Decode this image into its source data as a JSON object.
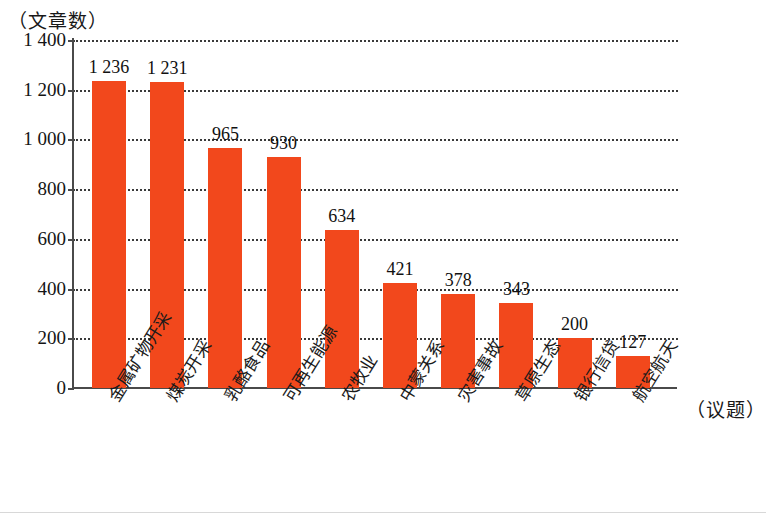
{
  "chart_data": {
    "type": "bar",
    "title": "",
    "subtitle": "",
    "xlabel": "（议题）",
    "ylabel": "（文章数）",
    "categories": [
      "金属矿物开采",
      "煤炭开采",
      "乳酪食品",
      "可再生能源",
      "农牧业",
      "中蒙关系",
      "灾害事故",
      "草原生态",
      "银行信贷",
      "航空航天"
    ],
    "values": [
      1236,
      1231,
      965,
      930,
      634,
      421,
      378,
      343,
      200,
      127
    ],
    "value_labels": [
      "1 236",
      "1 231",
      "965",
      "930",
      "634",
      "421",
      "378",
      "343",
      "200",
      "127"
    ],
    "ylim": [
      0,
      1400
    ],
    "y_ticks": [
      0,
      200,
      400,
      600,
      800,
      1000,
      1200,
      1400
    ],
    "y_tick_labels": [
      "0",
      "200",
      "400",
      "600",
      "800",
      "1 000",
      "1 200",
      "1 400"
    ],
    "grid": "horizontal-dotted",
    "legend": "none",
    "bar_color": "#F2481C",
    "axis_color": "#4A4A4A",
    "gridline_color": "#3A3A3A",
    "background_color": "#FFFFFF"
  }
}
